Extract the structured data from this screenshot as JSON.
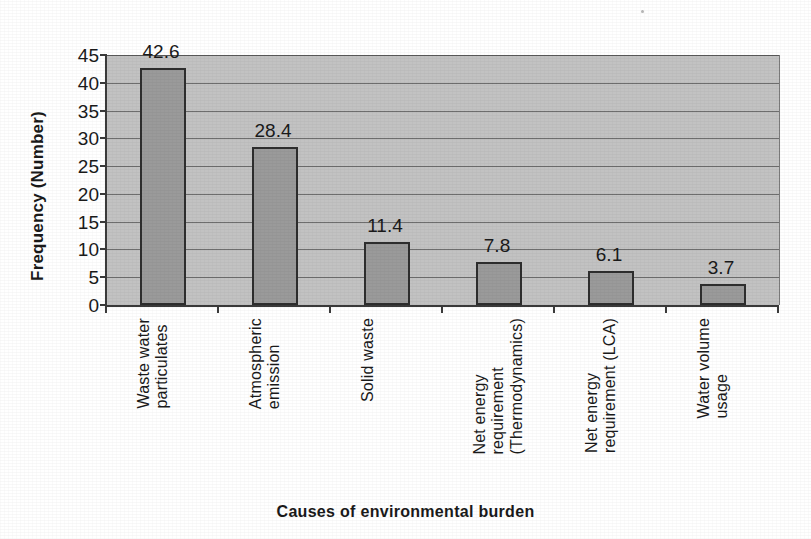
{
  "chart_data": {
    "type": "bar",
    "title": "",
    "xlabel": "Causes of environmental burden",
    "ylabel": "Frequency (Number)",
    "categories": [
      "Waste water particulates",
      "Atmospheric emission",
      "Solid waste",
      "Net energy requirement (Thermodynamics)",
      "Net energy requirement (LCA)",
      "Water volume usage"
    ],
    "category_lines": [
      "Waste water\nparticulates",
      "Atmospheric\nemission",
      "Solid waste",
      "Net energy\nrequirement\n(Thermodynamics)",
      "Net energy\nrequirement (LCA)",
      "Water volume\nusage"
    ],
    "values": [
      42.6,
      28.4,
      11.4,
      7.8,
      6.1,
      3.7
    ],
    "value_labels": [
      "42.6",
      "28.4",
      "11.4",
      "7.8",
      "6.1",
      "3.7"
    ],
    "ylim": [
      0,
      45
    ],
    "ytick_values": [
      0,
      5,
      10,
      15,
      20,
      25,
      30,
      35,
      40,
      45
    ],
    "ytick_labels": [
      "0",
      "5",
      "10",
      "15",
      "20",
      "25",
      "30",
      "35",
      "40",
      "45"
    ],
    "grid": true,
    "legend": false,
    "legend_position": "none",
    "orientation": "vertical"
  },
  "style": {
    "plot_background": "#c2c2c2",
    "bar_fill": "#9a9a9a",
    "bar_border": "#2e2e2e",
    "gridline_color": "#6e6e6e",
    "axis_color": "#3a3a3a",
    "text_color": "#1a1a1a",
    "page_background": "#ffffff"
  }
}
